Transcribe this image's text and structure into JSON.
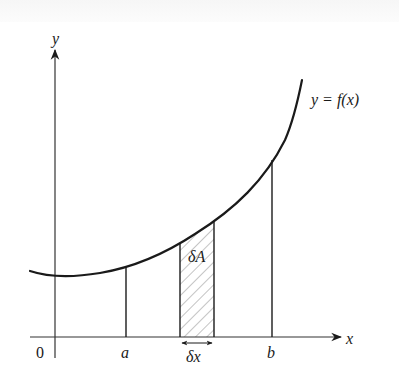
{
  "figure": {
    "curve_label": "y = f(x)",
    "axes": {
      "x_label": "x",
      "y_label": "y",
      "origin_label": "0"
    },
    "markers": {
      "a": "a",
      "b": "b"
    },
    "strip": {
      "area_label": "δA",
      "width_label": "δx"
    }
  },
  "colors": {
    "line": "#1a1a1a",
    "axis": "#333333",
    "hatch": "#8a8a8a",
    "background": "#ffffff"
  }
}
